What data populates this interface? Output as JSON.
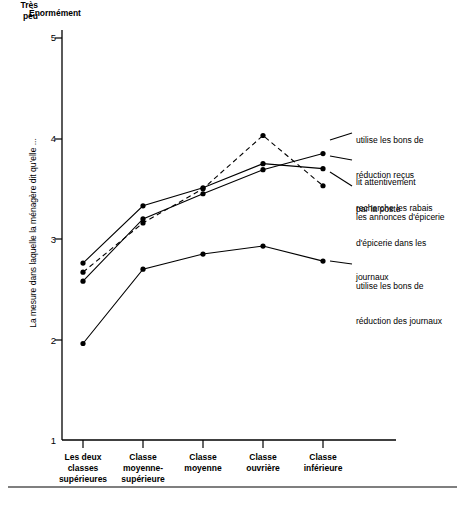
{
  "chart_data": {
    "type": "line",
    "title": "",
    "xlabel": "",
    "ylabel": "La mesure dans laquelle la ménagère dit qu'elle ...",
    "ylim": [
      1,
      5
    ],
    "yticks": [
      1,
      2,
      3,
      4,
      5
    ],
    "ytick_labels": [
      "1",
      "2",
      "3",
      "4",
      "5"
    ],
    "y_axis_top_label": "Énormément",
    "y_axis_bottom_label": "Très\npeu",
    "y_axis_bottom_label_line1": "Très",
    "y_axis_bottom_label_line2": "peu",
    "grid": false,
    "legend_position": "right-inline",
    "categories": [
      "Les deux\nclasses\nsupérieures",
      "Classe\nmoyenne-\nsupérieure",
      "Classe\nmoyenne",
      "Classe\nouvrière",
      "Classe\ninférieure"
    ],
    "category_labels": [
      {
        "line1": "Les deux",
        "line2": "classes",
        "line3": "supérieures"
      },
      {
        "line1": "Classe",
        "line2": "moyenne-",
        "line3": "supérieure"
      },
      {
        "line1": "Classe",
        "line2": "moyenne",
        "line3": ""
      },
      {
        "line1": "Classe",
        "line2": "ouvrière",
        "line3": ""
      },
      {
        "line1": "Classe",
        "line2": "inférieure",
        "line3": ""
      }
    ],
    "series": [
      {
        "name": "utilise les bons de réduction reçus par la poste",
        "style": "dashed",
        "values": [
          2.67,
          3.16,
          3.5,
          4.03,
          3.53
        ]
      },
      {
        "name": "lit attentivement les annonces d'épicerie",
        "style": "solid",
        "values": [
          2.76,
          3.33,
          3.51,
          3.75,
          3.7
        ]
      },
      {
        "name": "recherche les rabais d'épicerie dans les journaux",
        "style": "solid",
        "values": [
          2.58,
          3.2,
          3.45,
          3.69,
          3.85
        ]
      },
      {
        "name": "utilise les bons de réduction des journaux",
        "style": "solid",
        "values": [
          1.96,
          2.7,
          2.85,
          2.93,
          2.78
        ]
      }
    ],
    "legend": [
      {
        "line1": "utilise les bons de",
        "line2": "réduction reçus",
        "line3": "par la poste"
      },
      {
        "line1": "lit attentivement",
        "line2": "les annonces d'épicerie",
        "line3": ""
      },
      {
        "line1": "recherche les rabais",
        "line2": "d'épicerie dans les",
        "line3": "journaux"
      },
      {
        "line1": "utilise les bons de",
        "line2": "réduction des journaux",
        "line3": ""
      }
    ],
    "colors": {
      "line": "#000000",
      "marker": "#000000",
      "axis": "#000000",
      "background": "#ffffff"
    }
  }
}
